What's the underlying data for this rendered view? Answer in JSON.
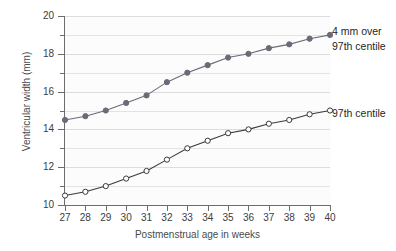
{
  "chart_data": {
    "type": "line",
    "title": "",
    "subtitle": "",
    "xlabel": "Postmenstrual age in weeks",
    "ylabel": "Ventricular width (mm)",
    "xlim": [
      27,
      40
    ],
    "ylim": [
      10,
      20
    ],
    "x": [
      27,
      28,
      29,
      30,
      31,
      32,
      33,
      34,
      35,
      36,
      37,
      38,
      39,
      40
    ],
    "xticks": [
      "27",
      "28",
      "29",
      "30",
      "31",
      "32",
      "33",
      "34",
      "35",
      "36",
      "37",
      "38",
      "39",
      "40"
    ],
    "yticks": [
      "10",
      "12",
      "14",
      "16",
      "18",
      "20"
    ],
    "ytick_values": [
      10,
      12,
      14,
      16,
      18,
      20
    ],
    "minor_gridlines": [
      11,
      13,
      15,
      17,
      19
    ],
    "grid": true,
    "grid_axis": "y",
    "legend_position": "right-of-plot-at-series-end",
    "series": [
      {
        "name": "4 mm over 97th centile",
        "marker": "filled-circle",
        "color": "#6b6b78",
        "values": [
          14.5,
          14.7,
          15.0,
          15.4,
          15.8,
          16.5,
          17.0,
          17.4,
          17.8,
          18.0,
          18.3,
          18.5,
          18.8,
          19.0
        ]
      },
      {
        "name": "97th centile",
        "marker": "open-circle",
        "color": "#3a3a3a",
        "values": [
          10.5,
          10.7,
          11.0,
          11.4,
          11.8,
          12.4,
          13.0,
          13.4,
          13.8,
          14.0,
          14.3,
          14.5,
          14.8,
          15.0
        ]
      }
    ],
    "annotations": []
  },
  "legend": {
    "upper_line1": "4  mm over",
    "upper_line2": "97th centile",
    "lower_line1": "97th centile"
  }
}
